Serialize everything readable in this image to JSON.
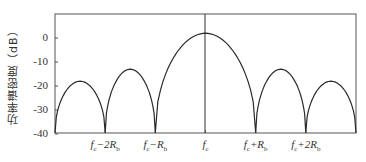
{
  "chart_data": {
    "type": "line",
    "title": "",
    "xlabel": "",
    "ylabel": "功率谱密度（dB）",
    "ylim": [
      -40,
      10
    ],
    "yticks": [
      0,
      -10,
      -20,
      -30,
      -40
    ],
    "ytick_labels": [
      "0",
      "-10",
      "-20",
      "-30",
      "-40"
    ],
    "x_tick_labels": [
      "fc-2Rb",
      "fc-Rb",
      "fc",
      "fc+Rb",
      "fc+2Rb"
    ],
    "x_tick_positions": [
      -2,
      -1,
      0,
      1,
      2
    ],
    "xlim": [
      -3,
      3
    ],
    "grid": false,
    "legend": null,
    "annotations": [
      "vertical line at fc"
    ],
    "series": [
      {
        "name": "power spectral density",
        "lobes": [
          {
            "from": -3,
            "to": -2,
            "peak_x": -2.5,
            "peak_db": -18
          },
          {
            "from": -2,
            "to": -1,
            "peak_x": -1.5,
            "peak_db": -13
          },
          {
            "from": -1,
            "to": 1,
            "peak_x": 0,
            "peak_db": 2
          },
          {
            "from": 1,
            "to": 2,
            "peak_x": 1.5,
            "peak_db": -13
          },
          {
            "from": 2,
            "to": 3,
            "peak_x": 2.5,
            "peak_db": -18
          }
        ]
      }
    ]
  },
  "labels": {
    "ylabel": "功率谱密度（dB）",
    "yticks": [
      "0",
      "-10",
      "-20",
      "-30",
      "-40"
    ],
    "xticks": [
      {
        "base": "f",
        "sub": "c",
        "rest": "−2R",
        "rest_sub": "b"
      },
      {
        "base": "f",
        "sub": "c",
        "rest": "−R",
        "rest_sub": "b"
      },
      {
        "base": "f",
        "sub": "c",
        "rest": "",
        "rest_sub": ""
      },
      {
        "base": "f",
        "sub": "c",
        "rest": "+R",
        "rest_sub": "b"
      },
      {
        "base": "f",
        "sub": "c",
        "rest": "+2R",
        "rest_sub": "b"
      }
    ]
  },
  "colors": {
    "line": "#2a2a2a",
    "axis": "#555555"
  }
}
